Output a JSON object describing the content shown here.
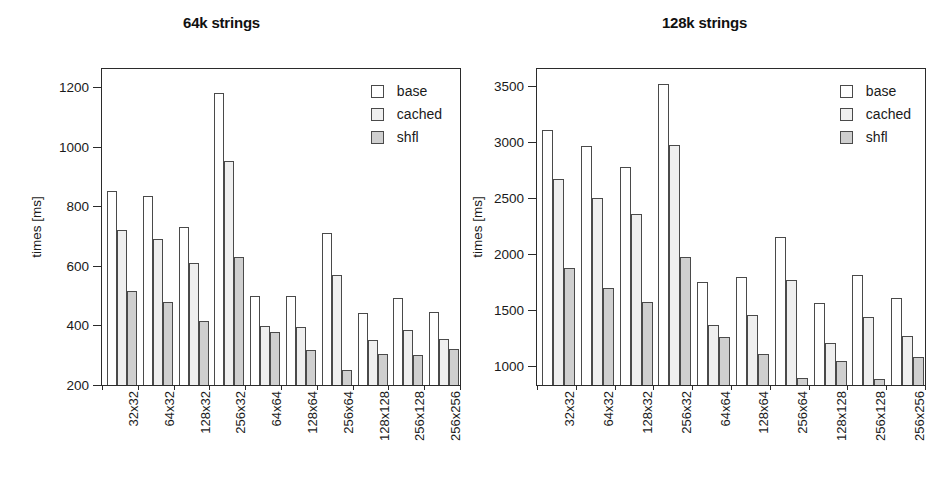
{
  "figure": {
    "background": "#ffffff",
    "series_colors": [
      "#ffffff",
      "#efefef",
      "#cfcfcf"
    ]
  },
  "chart_data": [
    {
      "type": "bar",
      "title": "64k strings",
      "xlabel": "",
      "ylabel": "times [ms]",
      "ylim": [
        200,
        1260
      ],
      "yticks": [
        200,
        400,
        600,
        800,
        1000,
        1200
      ],
      "ytick_labels": [
        "200",
        "400",
        "600",
        "800",
        "1000",
        "1200"
      ],
      "grid": false,
      "legend_position": "top-right",
      "categories": [
        "32x32",
        "64x32",
        "128x32",
        "256x32",
        "64x64",
        "128x64",
        "256x64",
        "128x128",
        "256x128",
        "256x256"
      ],
      "series": [
        {
          "name": "base",
          "values": [
            850,
            835,
            730,
            1178,
            500,
            500,
            710,
            442,
            492,
            445
          ]
        },
        {
          "name": "cached",
          "values": [
            720,
            690,
            608,
            950,
            398,
            395,
            568,
            350,
            385,
            355
          ]
        },
        {
          "name": "shfl",
          "values": [
            515,
            478,
            415,
            628,
            378,
            318,
            250,
            305,
            300,
            322
          ]
        }
      ]
    },
    {
      "type": "bar",
      "title": "128k strings",
      "xlabel": "",
      "ylabel": "times [ms]",
      "ylim": [
        830,
        3650
      ],
      "yticks": [
        1000,
        1500,
        2000,
        2500,
        3000,
        3500
      ],
      "ytick_labels": [
        "1000",
        "1500",
        "2000",
        "2500",
        "3000",
        "3500"
      ],
      "grid": false,
      "legend_position": "top-right",
      "categories": [
        "32x32",
        "64x32",
        "128x32",
        "256x32",
        "64x64",
        "128x64",
        "256x64",
        "128x128",
        "256x128",
        "256x256"
      ],
      "series": [
        {
          "name": "base",
          "values": [
            3105,
            2965,
            2780,
            3520,
            1745,
            1790,
            2155,
            1560,
            1810,
            1605
          ]
        },
        {
          "name": "cached",
          "values": [
            2670,
            2500,
            2360,
            2970,
            1370,
            1455,
            1770,
            1205,
            1440,
            1270
          ]
        },
        {
          "name": "shfl",
          "values": [
            1870,
            1695,
            1575,
            1975,
            1255,
            1105,
            895,
            1040,
            885,
            1080
          ]
        }
      ]
    }
  ]
}
